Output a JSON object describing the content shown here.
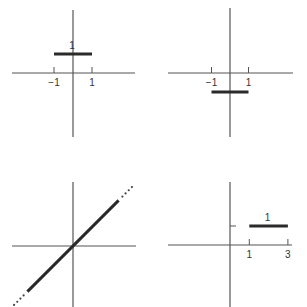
{
  "chart_data": [
    {
      "type": "line",
      "panel": "top-left",
      "title": "",
      "xlabel": "",
      "ylabel": "",
      "x_ticks": [
        -1,
        1
      ],
      "x_tick_labels": [
        "−1",
        "1"
      ],
      "y_ticks": [],
      "segments": [
        {
          "x": [
            -1,
            1
          ],
          "y": [
            1,
            1
          ],
          "style": "solid",
          "label": "1"
        }
      ],
      "xlim": [
        -3.2,
        3.3
      ],
      "ylim": [
        -3.4,
        3.3
      ],
      "grid": false
    },
    {
      "type": "line",
      "panel": "top-right",
      "title": "",
      "xlabel": "",
      "ylabel": "",
      "x_ticks": [
        -1,
        1
      ],
      "x_tick_labels": [
        "−1",
        "1"
      ],
      "y_ticks": [],
      "segments": [
        {
          "x": [
            -1,
            1
          ],
          "y": [
            -1,
            -1
          ],
          "style": "solid",
          "label": ""
        }
      ],
      "xlim": [
        -3.4,
        3.4
      ],
      "ylim": [
        -3.4,
        3.4
      ],
      "grid": false
    },
    {
      "type": "line",
      "panel": "bottom-left",
      "title": "",
      "xlabel": "",
      "ylabel": "",
      "x_ticks": [],
      "x_tick_labels": [],
      "y_ticks": [],
      "segments": [
        {
          "x": [
            -2.4,
            2.4
          ],
          "y": [
            -2.4,
            2.4
          ],
          "style": "solid",
          "label": ""
        },
        {
          "x": [
            2.6,
            3.1
          ],
          "y": [
            2.6,
            3.1
          ],
          "style": "dotted",
          "label": ""
        },
        {
          "x": [
            -3.1,
            -2.6
          ],
          "y": [
            -3.1,
            -2.6
          ],
          "style": "dotted",
          "label": ""
        }
      ],
      "function": "y = x",
      "xlim": [
        -3.2,
        3.3
      ],
      "ylim": [
        -3.2,
        3.4
      ],
      "grid": false
    },
    {
      "type": "line",
      "panel": "bottom-right",
      "title": "",
      "xlabel": "",
      "ylabel": "",
      "x_ticks": [
        1,
        3
      ],
      "x_tick_labels": [
        "1",
        "3"
      ],
      "y_ticks": [
        1
      ],
      "y_tick_labels": [
        ""
      ],
      "segments": [
        {
          "x": [
            1,
            3
          ],
          "y": [
            1,
            1
          ],
          "style": "solid",
          "label": "1"
        }
      ],
      "xlim": [
        -3.3,
        3.3
      ],
      "ylim": [
        -3.3,
        3.3
      ],
      "grid": false
    }
  ]
}
